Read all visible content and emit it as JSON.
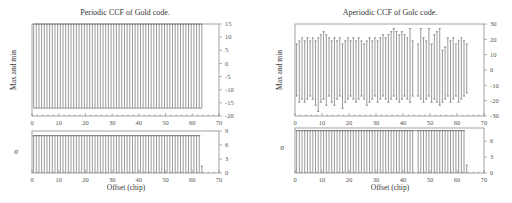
{
  "chart_data": [
    {
      "id": "left-top",
      "type": "bar",
      "subtype": "range",
      "title": "Periodic CCF of Gold code.",
      "xlabel": "",
      "ylabel": "Max and min",
      "xlim": [
        0,
        70
      ],
      "ylim": [
        -20,
        15
      ],
      "xticks": [
        0,
        10,
        20,
        30,
        40,
        50,
        60,
        70
      ],
      "yticks": [
        -20,
        -15,
        -10,
        -5,
        0,
        5,
        10,
        15
      ],
      "yaxis_side": "right",
      "x": [
        0,
        1,
        2,
        3,
        4,
        5,
        6,
        7,
        8,
        9,
        10,
        11,
        12,
        13,
        14,
        15,
        16,
        17,
        18,
        19,
        20,
        21,
        22,
        23,
        24,
        25,
        26,
        27,
        28,
        29,
        30,
        31,
        32,
        33,
        34,
        35,
        36,
        37,
        38,
        39,
        40,
        41,
        42,
        43,
        44,
        45,
        46,
        47,
        48,
        49,
        50,
        51,
        52,
        53,
        54,
        55,
        56,
        57,
        58,
        59,
        60,
        61,
        62,
        63
      ],
      "max": [
        15,
        15,
        15,
        15,
        15,
        15,
        15,
        15,
        15,
        15,
        15,
        15,
        15,
        15,
        15,
        15,
        15,
        15,
        15,
        15,
        15,
        15,
        15,
        15,
        15,
        15,
        15,
        15,
        15,
        15,
        15,
        15,
        15,
        15,
        15,
        15,
        15,
        15,
        15,
        15,
        15,
        15,
        15,
        15,
        15,
        15,
        15,
        15,
        15,
        15,
        15,
        15,
        15,
        15,
        15,
        15,
        15,
        15,
        15,
        15,
        15,
        15,
        15,
        15
      ],
      "min": [
        -17,
        -17,
        -17,
        -17,
        -17,
        -17,
        -17,
        -17,
        -17,
        -17,
        -17,
        -17,
        -17,
        -17,
        -17,
        -17,
        -17,
        -17,
        -17,
        -17,
        -17,
        -17,
        -17,
        -17,
        -17,
        -17,
        -17,
        -17,
        -17,
        -17,
        -17,
        -17,
        -17,
        -17,
        -17,
        -17,
        -17,
        -17,
        -17,
        -17,
        -17,
        -17,
        -17,
        -17,
        -17,
        -17,
        -17,
        -17,
        -17,
        -17,
        -17,
        -17,
        -17,
        -17,
        -17,
        -17,
        -17,
        -17,
        -17,
        -17,
        -17,
        -17,
        -17,
        -17
      ],
      "grid": false
    },
    {
      "id": "left-bottom",
      "type": "bar",
      "title": "",
      "xlabel": "Offset (chip)",
      "ylabel": "σ",
      "xlim": [
        0,
        70
      ],
      "ylim": [
        0,
        9
      ],
      "xticks": [
        0,
        10,
        20,
        30,
        40,
        50,
        60,
        70
      ],
      "yticks": [
        0,
        3,
        6,
        9
      ],
      "yaxis_side": "right",
      "x": [
        0,
        1,
        2,
        3,
        4,
        5,
        6,
        7,
        8,
        9,
        10,
        11,
        12,
        13,
        14,
        15,
        16,
        17,
        18,
        19,
        20,
        21,
        22,
        23,
        24,
        25,
        26,
        27,
        28,
        29,
        30,
        31,
        32,
        33,
        34,
        35,
        36,
        37,
        38,
        39,
        40,
        41,
        42,
        43,
        44,
        45,
        46,
        47,
        48,
        49,
        50,
        51,
        52,
        53,
        54,
        55,
        56,
        57,
        58,
        59,
        60,
        61,
        62,
        63
      ],
      "values": [
        8,
        8,
        8,
        8,
        8,
        8,
        8,
        8,
        8,
        8,
        8,
        8,
        8,
        8,
        8,
        8,
        8,
        8,
        8,
        8,
        8,
        8,
        8,
        8,
        8,
        8,
        8,
        8,
        8,
        8,
        8,
        8,
        8,
        8,
        8,
        8,
        8,
        8,
        8,
        8,
        8,
        8,
        8,
        8,
        8,
        8,
        8,
        8,
        8,
        8,
        8,
        8,
        8,
        8,
        8,
        8,
        8,
        8,
        8,
        8,
        8,
        8,
        8,
        1.5
      ],
      "grid": false
    },
    {
      "id": "right-top",
      "type": "bar",
      "subtype": "range",
      "title": "Aperiodic CCF of Golc code.",
      "xlabel": "",
      "ylabel": "Max and min",
      "xlim": [
        0,
        70
      ],
      "ylim": [
        -30,
        30
      ],
      "xticks": [
        0,
        10,
        20,
        30,
        40,
        50,
        60,
        70
      ],
      "yticks": [
        -30,
        -20,
        -10,
        0,
        10,
        20,
        30
      ],
      "yaxis_side": "right",
      "x": [
        0,
        1,
        2,
        3,
        4,
        5,
        6,
        7,
        8,
        9,
        10,
        11,
        12,
        13,
        14,
        15,
        16,
        17,
        18,
        19,
        20,
        21,
        22,
        23,
        24,
        25,
        26,
        27,
        28,
        29,
        30,
        31,
        32,
        33,
        34,
        35,
        36,
        37,
        38,
        39,
        40,
        41,
        42,
        43,
        44,
        45,
        46,
        47,
        48,
        49,
        50,
        51,
        52,
        53,
        54,
        55,
        56,
        57,
        58,
        59,
        60,
        61,
        62,
        63
      ],
      "max": [
        17,
        19,
        21,
        19,
        21,
        19,
        21,
        19,
        21,
        23,
        25,
        23,
        21,
        19,
        21,
        19,
        21,
        17,
        19,
        21,
        19,
        21,
        19,
        21,
        19,
        17,
        19,
        21,
        19,
        21,
        19,
        21,
        23,
        21,
        23,
        25,
        27,
        25,
        23,
        25,
        23,
        21,
        27,
        19,
        0,
        17,
        27,
        21,
        19,
        27,
        17,
        23,
        25,
        27,
        13,
        15,
        21,
        19,
        21,
        17,
        19,
        21,
        19,
        17
      ],
      "min": [
        -17,
        -21,
        -19,
        -21,
        -19,
        -17,
        -19,
        -23,
        -27,
        -21,
        -19,
        -23,
        -17,
        -21,
        -23,
        -19,
        -17,
        -25,
        -21,
        -19,
        -17,
        -19,
        -21,
        -19,
        -17,
        -19,
        -23,
        -21,
        -19,
        -17,
        -21,
        -19,
        -17,
        -19,
        -21,
        -19,
        -17,
        -19,
        -21,
        -19,
        -17,
        -19,
        -21,
        -17,
        0,
        -17,
        -19,
        -21,
        -19,
        -17,
        -21,
        -19,
        -21,
        -23,
        -21,
        -19,
        -17,
        -21,
        -19,
        -17,
        -21,
        -19,
        -17,
        -15
      ],
      "grid": false
    },
    {
      "id": "right-bottom",
      "type": "bar",
      "title": "",
      "xlabel": "Offset (chip)",
      "ylabel": "σ",
      "xlim": [
        0,
        70
      ],
      "ylim": [
        0,
        8.5
      ],
      "xticks": [
        0,
        10,
        20,
        30,
        40,
        50,
        60,
        70
      ],
      "yticks": [
        0,
        3,
        6
      ],
      "yaxis_side": "right",
      "x": [
        0,
        1,
        2,
        3,
        4,
        5,
        6,
        7,
        8,
        9,
        10,
        11,
        12,
        13,
        14,
        15,
        16,
        17,
        18,
        19,
        20,
        21,
        22,
        23,
        24,
        25,
        26,
        27,
        28,
        29,
        30,
        31,
        32,
        33,
        34,
        35,
        36,
        37,
        38,
        39,
        40,
        41,
        42,
        43,
        44,
        45,
        46,
        47,
        48,
        49,
        50,
        51,
        52,
        53,
        54,
        55,
        56,
        57,
        58,
        59,
        60,
        61,
        62,
        63
      ],
      "values": [
        8,
        8,
        8,
        8,
        8,
        8,
        8,
        8,
        8,
        8,
        8,
        8,
        8,
        8,
        8,
        8,
        8,
        8,
        8,
        8,
        8,
        8,
        8,
        8,
        8,
        8,
        8,
        8,
        8,
        8,
        8,
        8,
        8,
        8,
        8,
        8,
        8,
        8,
        8,
        8,
        8,
        8,
        8,
        8,
        0,
        8,
        8,
        8,
        8,
        8,
        8,
        8,
        8,
        8,
        8,
        8,
        8,
        8,
        8,
        8,
        8,
        8,
        8,
        1.5
      ],
      "grid": false
    }
  ],
  "panels": {
    "left": {
      "title": "Periodic CCF of Gold code.",
      "top_ylabel": "Max and min",
      "bottom_ylabel": "σ",
      "xlabel": "Offset (chip)"
    },
    "right": {
      "title": "Aperiodic CCF of Golc code.",
      "top_ylabel": "Max and min",
      "bottom_ylabel": "σ",
      "xlabel": "Offset (chip)"
    }
  },
  "colors": {
    "bar": "#555555",
    "frame": "#666666",
    "text": "#333333"
  }
}
